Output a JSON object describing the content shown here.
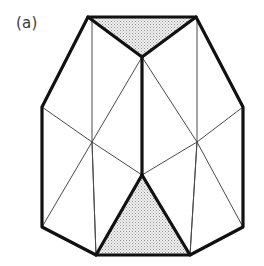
{
  "figure": {
    "label": "(a)",
    "caption_text": "(a)",
    "type": "polyhedron-line-drawing",
    "width": 264,
    "height": 266,
    "background_color": "#ffffff"
  },
  "style": {
    "outline_color": "#111111",
    "outline_width": 3.2,
    "interior_color": "#4a4a4a",
    "interior_width": 1.0,
    "thick_interior_width": 3.2,
    "stipple_fill_color": "#e9e9e9",
    "stipple_dot_color": "#8a8a8a",
    "label_color": "#3a3a3a"
  },
  "geometry": {
    "vertices": {
      "top_left": [
        88,
        17
      ],
      "top_right": [
        196,
        17
      ],
      "left_upper": [
        42,
        107
      ],
      "right_upper": [
        243,
        107
      ],
      "left_lower": [
        42,
        227
      ],
      "right_lower": [
        243,
        227
      ],
      "bottom_left": [
        96,
        255
      ],
      "bottom_right": [
        190,
        255
      ],
      "apex_center": [
        142,
        57
      ],
      "interior_left": [
        92,
        142
      ],
      "interior_right": [
        197,
        142
      ],
      "center_bottom": [
        142,
        175
      ],
      "rear_left_top": [
        92,
        17
      ],
      "rear_right_top": [
        197,
        17
      ]
    },
    "outline_path": "M 88 17 L 196 17 L 243 107 L 243 227 L 190 255 L 96 255 L 42 227 L 42 107 Z",
    "shaded_faces": [
      {
        "name": "top-stippled-face",
        "points": "88,17 196,17 142,57"
      },
      {
        "name": "bottom-stippled-face",
        "points": "142,175 190,255 96,255"
      }
    ],
    "thick_edges": [
      {
        "name": "top-face-left-fold",
        "from": [
          88,
          17
        ],
        "to": [
          142,
          57
        ]
      },
      {
        "name": "top-face-right-fold",
        "from": [
          196,
          17
        ],
        "to": [
          142,
          57
        ]
      },
      {
        "name": "central-vertical-spine",
        "from": [
          142,
          57
        ],
        "to": [
          142,
          175
        ]
      },
      {
        "name": "bottom-face-left-fold",
        "from": [
          142,
          175
        ],
        "to": [
          96,
          255
        ]
      },
      {
        "name": "bottom-face-right-fold",
        "from": [
          142,
          175
        ],
        "to": [
          190,
          255
        ]
      }
    ],
    "thin_edges": [
      {
        "name": "left-vertical-rear-edge",
        "from": [
          92,
          17
        ],
        "to": [
          92,
          142
        ]
      },
      {
        "name": "left-vertical-lower-edge",
        "from": [
          92,
          142
        ],
        "to": [
          96,
          255
        ]
      },
      {
        "name": "right-vertical-rear-edge",
        "from": [
          197,
          17
        ],
        "to": [
          197,
          142
        ]
      },
      {
        "name": "right-vertical-lower-edge",
        "from": [
          197,
          142
        ],
        "to": [
          190,
          255
        ]
      },
      {
        "name": "left-girdle-edge",
        "from": [
          42,
          107
        ],
        "to": [
          92,
          142
        ]
      },
      {
        "name": "right-girdle-edge",
        "from": [
          243,
          107
        ],
        "to": [
          197,
          142
        ]
      },
      {
        "name": "left-lower-girdle-edge",
        "from": [
          42,
          227
        ],
        "to": [
          92,
          142
        ]
      },
      {
        "name": "right-lower-girdle-edge",
        "from": [
          243,
          227
        ],
        "to": [
          197,
          142
        ]
      },
      {
        "name": "left-center-diagonal",
        "from": [
          92,
          142
        ],
        "to": [
          142,
          175
        ]
      },
      {
        "name": "right-center-diagonal",
        "from": [
          197,
          142
        ],
        "to": [
          142,
          175
        ]
      },
      {
        "name": "apex-to-left-interior",
        "from": [
          142,
          57
        ],
        "to": [
          92,
          142
        ]
      },
      {
        "name": "apex-to-right-interior",
        "from": [
          142,
          57
        ],
        "to": [
          197,
          142
        ]
      },
      {
        "name": "left-interior-to-bottom-left",
        "from": [
          92,
          142
        ],
        "to": [
          96,
          255
        ]
      },
      {
        "name": "right-interior-to-bottom-right",
        "from": [
          197,
          142
        ],
        "to": [
          190,
          255
        ]
      }
    ]
  }
}
